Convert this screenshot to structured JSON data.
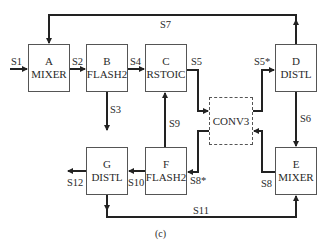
{
  "diagram": {
    "caption": "(c)",
    "blocks": {
      "A": {
        "id": "A",
        "type": "MIXER"
      },
      "B": {
        "id": "B",
        "type": "FLASH2"
      },
      "C": {
        "id": "C",
        "type": "RSTOIC"
      },
      "D": {
        "id": "D",
        "type": "DISTL"
      },
      "E": {
        "id": "E",
        "type": "MIXER"
      },
      "F": {
        "id": "F",
        "type": "FLASH2"
      },
      "G": {
        "id": "G",
        "type": "DISTL"
      },
      "CONV3": {
        "id": "",
        "type": "CONV3"
      }
    },
    "streams": {
      "S1": "S1",
      "S2": "S2",
      "S3": "S3",
      "S4": "S4",
      "S5": "S5",
      "S5star": "S5*",
      "S6": "S6",
      "S7": "S7",
      "S8": "S8",
      "S8star": "S8*",
      "S9": "S9",
      "S10": "S10",
      "S11": "S11",
      "S12": "S12"
    },
    "connections": [
      {
        "stream": "S1",
        "from": "feed",
        "to": "A"
      },
      {
        "stream": "S2",
        "from": "A",
        "to": "B"
      },
      {
        "stream": "S3",
        "from": "B",
        "to": "product"
      },
      {
        "stream": "S4",
        "from": "B",
        "to": "C"
      },
      {
        "stream": "S5",
        "from": "C",
        "to": "CONV3"
      },
      {
        "stream": "S5*",
        "from": "CONV3",
        "to": "D"
      },
      {
        "stream": "S6",
        "from": "D",
        "to": "E"
      },
      {
        "stream": "S7",
        "from": "D",
        "to": "A"
      },
      {
        "stream": "S8",
        "from": "E",
        "to": "CONV3"
      },
      {
        "stream": "S8*",
        "from": "CONV3",
        "to": "F"
      },
      {
        "stream": "S9",
        "from": "F",
        "to": "C"
      },
      {
        "stream": "S10",
        "from": "F",
        "to": "G"
      },
      {
        "stream": "S11",
        "from": "G",
        "to": "E"
      },
      {
        "stream": "S12",
        "from": "G",
        "to": "product"
      }
    ]
  }
}
